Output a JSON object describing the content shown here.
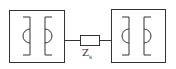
{
  "diagram": {
    "type": "circuit-schematic",
    "left_block": {
      "label": "",
      "elements": [
        "bracket-semicircle-left",
        "bracket-semicircle-right"
      ]
    },
    "right_block": {
      "label": "",
      "elements": [
        "bracket-semicircle-left",
        "bracket-semicircle-right"
      ]
    },
    "impedance": {
      "symbol": "Z",
      "subscript": "s"
    },
    "colors": {
      "stroke": "#333333",
      "background": "#ffffff"
    }
  }
}
